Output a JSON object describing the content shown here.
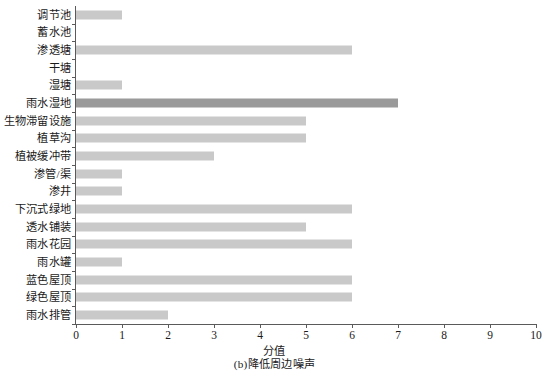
{
  "chart_data": {
    "type": "bar",
    "orientation": "horizontal",
    "title": "",
    "subtitle": "",
    "xlabel": "分值",
    "ylabel": "",
    "xlim": [
      0,
      10
    ],
    "xticks": [
      0,
      1,
      2,
      3,
      4,
      5,
      6,
      7,
      8,
      9,
      10
    ],
    "xtick_labels": [
      "0",
      "1",
      "2",
      "3",
      "4",
      "5",
      "6",
      "7",
      "8",
      "9",
      "10"
    ],
    "grid": false,
    "legend": null,
    "caption": "(b)降低周边噪声",
    "categories": [
      "调节池",
      "蓄水池",
      "渗透塘",
      "干塘",
      "湿塘",
      "雨水湿地",
      "生物滞留设施",
      "植草沟",
      "植被缓冲带",
      "渗管/渠",
      "渗井",
      "下沉式绿地",
      "透水铺装",
      "雨水花园",
      "雨水罐",
      "蓝色屋顶",
      "绿色屋顶",
      "雨水排管"
    ],
    "values": [
      1,
      0,
      6,
      0,
      1,
      7,
      5,
      5,
      3,
      1,
      1,
      6,
      5,
      6,
      1,
      6,
      6,
      2
    ],
    "bar_colors": [
      "#c9c9c9",
      "#c9c9c9",
      "#c9c9c9",
      "#c9c9c9",
      "#c9c9c9",
      "#9a9a9a",
      "#c9c9c9",
      "#c9c9c9",
      "#c9c9c9",
      "#c9c9c9",
      "#c9c9c9",
      "#c9c9c9",
      "#c9c9c9",
      "#c9c9c9",
      "#c9c9c9",
      "#c9c9c9",
      "#c9c9c9",
      "#c9c9c9"
    ],
    "colors": {
      "bar_default": "#c9c9c9",
      "bar_highlight": "#9a9a9a",
      "axis": "#5a5a5a",
      "text": "#1a1a1a",
      "background": "#ffffff"
    }
  }
}
